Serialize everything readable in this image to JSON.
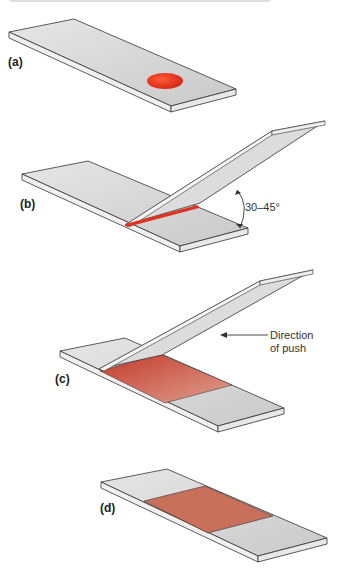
{
  "figure": {
    "panels": [
      {
        "id": "a",
        "label": "(a)",
        "description": "Drop of blood placed on glass slide"
      },
      {
        "id": "b",
        "label": "(b)",
        "description": "Spreader slide held at angle, blood spreads along edge",
        "angle_label": "30–45°"
      },
      {
        "id": "c",
        "label": "(c)",
        "description": "Spreader pushed forward creating smear",
        "arrow_label_line1": "Direction",
        "arrow_label_line2": "of push"
      },
      {
        "id": "d",
        "label": "(d)",
        "description": "Finished blood smear"
      }
    ],
    "colors": {
      "slide": "#d9d9d9",
      "slide_edge": "#f2f2f2",
      "outline": "#333333",
      "blood_drop": "#e8321e",
      "smear": "#c8604a"
    }
  }
}
